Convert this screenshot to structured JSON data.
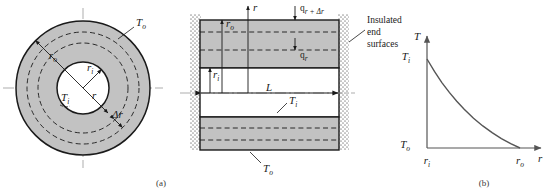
{
  "figure": {
    "panels": [
      {
        "id": "a",
        "caption": "(a)"
      },
      {
        "id": "b",
        "caption": "(b)"
      }
    ]
  },
  "colors": {
    "solid_fill": "#c2c2c2",
    "void_fill": "#ffffff",
    "outline": "#1a1a1a",
    "dashed": "#1a1a1a",
    "centerline": "#808080",
    "curve": "#555555",
    "insulation": "#b8b8b8"
  },
  "panel_a": {
    "name": "annulus-cross-section",
    "labels": {
      "outer_temp": "T",
      "outer_temp_sub": "o",
      "inner_temp": "T",
      "inner_temp_sub": "i",
      "outer_radius": "r",
      "outer_radius_sub": "o",
      "inner_radius": "r",
      "inner_radius_sub": "i",
      "radius": "r",
      "shell_thickness": "Δr"
    }
  },
  "panel_mid": {
    "name": "longitudinal-section",
    "labels": {
      "radial_axis": "r",
      "flux_out": "q",
      "flux_out_sub": "r + Δr",
      "flux_in": "q",
      "flux_in_sub": "r",
      "outer_radius": "r",
      "outer_radius_sub": "o",
      "inner_radius": "r",
      "inner_radius_sub": "i",
      "length": "L",
      "inner_temp": "T",
      "inner_temp_sub": "i",
      "outer_temp": "T",
      "outer_temp_sub": "o",
      "insulated_line1": "Insulated",
      "insulated_line2": "end",
      "insulated_line3": "surfaces"
    }
  },
  "chart_data": {
    "type": "line",
    "title": "",
    "xlabel": "r",
    "ylabel": "T",
    "x_ticks": [
      "r",
      "r"
    ],
    "x_tick_subs": [
      "i",
      "o"
    ],
    "y_ticks": [
      "T",
      "T"
    ],
    "y_tick_subs": [
      "i",
      "o"
    ],
    "x": [
      0.0,
      0.08,
      0.16,
      0.24,
      0.32,
      0.4,
      0.5,
      0.6,
      0.7,
      0.8,
      0.9,
      1.0
    ],
    "values": [
      1.0,
      0.86,
      0.735,
      0.625,
      0.525,
      0.435,
      0.335,
      0.248,
      0.172,
      0.105,
      0.048,
      0.0
    ],
    "xlim": [
      0,
      1
    ],
    "ylim": [
      0,
      1
    ],
    "grid": false,
    "legend": null,
    "note": "Logarithmic temperature decay from T_i at r_i to T_o at r_o"
  }
}
